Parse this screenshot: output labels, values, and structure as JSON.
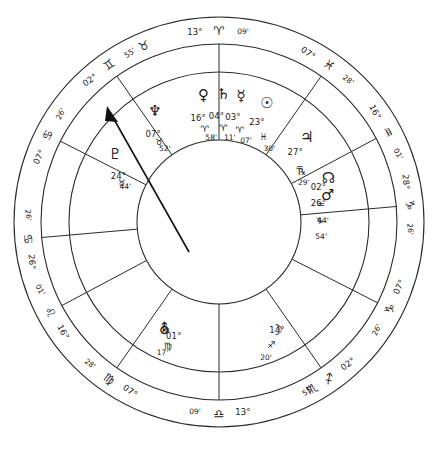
{
  "chart_data": {
    "type": "other",
    "chart_kind": "astrological-natal-wheel",
    "title": "",
    "rings": [
      "outer-sign-ring",
      "house-cusp-ring",
      "planet-ring",
      "inner-circle"
    ],
    "house_cusps": [
      {
        "id": "cusp-mc",
        "deg": "13°",
        "sign": "aries",
        "glyph": "♈",
        "min": "09'",
        "angle_deg": 90,
        "label": "13° Aries 09'"
      },
      {
        "id": "cusp-asc",
        "deg": "07°",
        "sign": "pisces",
        "glyph": "♓",
        "min": "28'",
        "angle_deg": 55,
        "label": "07° Pisces 28'"
      },
      {
        "id": "cusp-11",
        "deg": "16°",
        "sign": "aquarius",
        "glyph": "♒",
        "min": "01'",
        "angle_deg": 28,
        "label": "16° Aquarius 01'"
      },
      {
        "id": "cusp-10",
        "deg": "28°",
        "sign": "capricorn",
        "glyph": "♑",
        "min": "26'",
        "angle_deg": 5,
        "label": "28° Capricorn 26'"
      },
      {
        "id": "cusp-dsc",
        "deg": "07°",
        "sign": "capricorn",
        "glyph": "♑",
        "min": "26'",
        "angle_deg": -27,
        "label": "07° Capricorn 26'"
      },
      {
        "id": "cusp-8",
        "deg": "02°",
        "sign": "sagittarius",
        "glyph": "♐",
        "min": "55'",
        "angle_deg": -55,
        "label": "02° Sagittarius 55'"
      },
      {
        "id": "cusp-ic",
        "deg": "13°",
        "sign": "libra",
        "glyph": "♎",
        "min": "09'",
        "angle_deg": -90,
        "label": "13° Libra 09'"
      },
      {
        "id": "cusp-6",
        "deg": "07°",
        "sign": "virgo",
        "glyph": "♍",
        "min": "28'",
        "angle_deg": -125,
        "label": "07° Virgo 28'"
      },
      {
        "id": "cusp-5",
        "deg": "16°",
        "sign": "leo",
        "glyph": "♌",
        "min": "01'",
        "angle_deg": -152,
        "label": "16° Leo 01'"
      },
      {
        "id": "cusp-4",
        "deg": "26°",
        "sign": "cancer",
        "glyph": "♋",
        "min": "26'",
        "angle_deg": -175,
        "label": "26° Cancer 26'"
      },
      {
        "id": "cusp-3",
        "deg": "07°",
        "sign": "cancer",
        "glyph": "♋",
        "min": "26'",
        "angle_deg": 153,
        "label": "07° Cancer 26'"
      },
      {
        "id": "cusp-2",
        "deg": "02°",
        "sign": "gemini",
        "glyph": "♊",
        "min": "55'",
        "angle_deg": 125,
        "label": "02° Gemini 55'"
      }
    ],
    "sign_ring_glyphs": [
      {
        "id": "sign-taurus",
        "glyph": "♉",
        "angle_deg": 113,
        "name": "taurus"
      },
      {
        "id": "sign-scorpio",
        "glyph": "♏",
        "angle_deg": -61,
        "name": "scorpio"
      }
    ],
    "planets": [
      {
        "id": "venus",
        "name": "Venus",
        "glyph": "♀",
        "deg": "16°",
        "sign_glyph": "♈",
        "sign": "aries",
        "min": "58'",
        "retrograde": false
      },
      {
        "id": "saturn",
        "name": "Saturn",
        "glyph": "♄",
        "deg": "04°",
        "sign_glyph": "♈",
        "sign": "aries",
        "min": "11'",
        "retrograde": false
      },
      {
        "id": "mercury",
        "name": "Mercury",
        "glyph": "☿",
        "deg": "03°",
        "sign_glyph": "♈",
        "sign": "aries",
        "min": "07'",
        "retrograde": false
      },
      {
        "id": "sun",
        "name": "Sun",
        "glyph": "☉",
        "deg": "23°",
        "sign_glyph": "♓",
        "sign": "pisces",
        "min": "30'",
        "retrograde": false
      },
      {
        "id": "jupiter",
        "name": "Jupiter",
        "glyph": "♃",
        "deg": "27°",
        "sign_glyph": "♒",
        "sign": "aquarius",
        "min": "29'",
        "retrograde": false
      },
      {
        "id": "node",
        "name": "North Node",
        "glyph": "☊",
        "deg": "02°",
        "sign_glyph": "♒",
        "sign": "aquarius",
        "min": "44'",
        "retrograde": true
      },
      {
        "id": "mars",
        "name": "Mars",
        "glyph": "♂",
        "deg": "26°",
        "sign_glyph": "♑",
        "sign": "capricorn",
        "min": "54'",
        "retrograde": false
      },
      {
        "id": "moon",
        "name": "Moon",
        "glyph": "☽",
        "deg": "14°",
        "sign_glyph": "♐",
        "sign": "sagittarius",
        "min": "20'",
        "retrograde": false
      },
      {
        "id": "uranus",
        "name": "Uranus",
        "glyph": "⛢",
        "deg": "01°",
        "sign_glyph": "♍",
        "sign": "virgo",
        "min": "17'",
        "retrograde": true
      },
      {
        "id": "pluto",
        "name": "Pluto",
        "glyph": "♇",
        "deg": "24°",
        "sign_glyph": "♉",
        "sign": "taurus",
        "min": "44'",
        "retrograde": false
      },
      {
        "id": "neptune",
        "name": "Neptune",
        "glyph": "♆",
        "deg": "07°",
        "sign_glyph": "♉",
        "sign": "taurus",
        "min": "52'",
        "retrograde": false
      }
    ],
    "ascendant_marker": {
      "id": "asc-arrow",
      "angle_deg": 55,
      "label": "ascendant-arrow"
    },
    "retrograde_symbol": "℞",
    "colors": {
      "stroke": "#2b2b2b",
      "text": "#1a1a1a",
      "background": "#ffffff"
    }
  }
}
